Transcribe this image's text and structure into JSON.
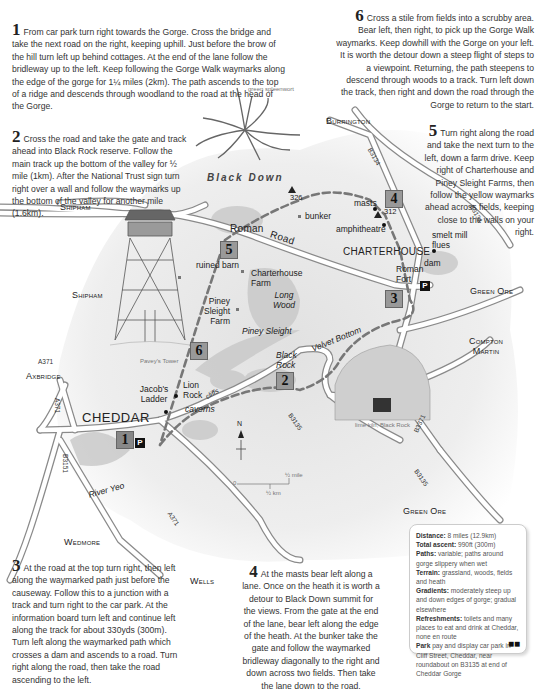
{
  "steps": [
    {
      "number": "1",
      "text": "From car park turn right towards the Gorge. Cross the bridge and take the next road on the right, keeping uphill. Just before the brow of the hill turn left up behind cottages. At the end of the lane follow the bridleway up to the left. Keep following the Gorge Walk waymarks along the edge of the gorge for 1¼ miles (2km). The path ascends to the top of a ridge and descends through woodland to the road at the head of the Gorge."
    },
    {
      "number": "2",
      "text": "Cross the road and take the gate and track ahead into Black Rock reserve. Follow the main track up the bottom of the valley for ½ mile (1km). After the National Trust sign turn right over a wall and follow the waymarks up the bottom of the valley for another mile (1.6km)."
    },
    {
      "number": "3",
      "text": "At the road at the top turn right, then left along the waymarked path just before the causeway. Follow this to a junction with a track and turn right to the car park. At the information board turn left and continue left along the track for about 330yds (300m). Turn left along the waymarked path which crosses a dam and ascends to a road. Turn right along the road, then take the road ascending to the left."
    },
    {
      "number": "4",
      "text": "At the masts bear left along a lane. Once on the heath it is worth a detour to Black Down summit for the views. From the gate at the end of the lane, bear left along the edge of the heath. At the bunker take the gate and follow the waymarked bridleway diagonally to the right and down across two fields. Then take the lane down to the road."
    },
    {
      "number": "5",
      "text": "Turn right along the road and take the next turn to the left, down a farm drive. Keep right of Charterhouse and Piney Sleight Farms, then follow the yellow waymarks ahead across fields, keeping close to the walls on your right."
    },
    {
      "number": "6",
      "text": "Cross a stile from fields into a scrubby area. Bear left, then right, to pick up the Gorge Walk waymarks. Keep dowhill with the Gorge on your left. It is worth the detour down a steep flight of steps to a viewpoint. Returning, the path steepens to descend through woods to a track. Turn left down the track, then right and down the road through the Gorge to return to the start."
    }
  ],
  "map": {
    "places": {
      "burrington": "Burrington",
      "shipham_top": "Shipham",
      "shipham_mid": "Shipham",
      "axbridge": "Axbridge",
      "wedmore": "Wedmore",
      "wells": "Wells",
      "green_ore_top": "Green Ore",
      "green_ore_bottom": "Green Ore",
      "compton_martin": "Compton Martin",
      "cheddar": "CHEDDAR",
      "charterhouse": "CHARTERHOUSE",
      "black_down": "Black Down",
      "roman_road": "Roman Road",
      "roman": "Roman",
      "road": "Road",
      "masts": "masts",
      "peak_312": "312",
      "peak_326": "326",
      "bunker": "bunker",
      "amphitheatre": "amphitheatre",
      "smelt_mill_flues": "smelt mill flues",
      "dam": "dam",
      "roman_fort": "Roman Fort",
      "ruined_barn": "ruined barn",
      "charterhouse_farm": "Charterhouse Farm",
      "piney_sleight_farm": "Piney Sleight Farm",
      "piney_sleight": "Piney Sleight",
      "long_wood": "Long Wood",
      "velvet_bottom": "Velvet Bottom",
      "black_rock": "Black Rock",
      "jacobs_ladder": "Jacob's Ladder",
      "lion_rock": "Lion Rock",
      "cliffs": "cliffs",
      "caverns": "caverns",
      "river_yeo": "River Yeo"
    },
    "roads": {
      "b3134_top": "B3134",
      "b3134_right": "B3134",
      "a371_left": "A371",
      "a371_vertical": "A371",
      "a371_bottom": "A371",
      "b3151": "B3151",
      "b3135_mid": "B3135",
      "b3135_right": "B3135",
      "b3371": "B3371"
    },
    "markers": [
      "1",
      "2",
      "3",
      "4",
      "5",
      "6"
    ],
    "parking_label": "P",
    "illustrations": {
      "fern": "green spleenwort",
      "tower": "Pavey's Tower",
      "limekiln": "lime kiln, Black Rock"
    },
    "compass": "N",
    "scale": {
      "zero": "0",
      "miles": "½ mile",
      "km": "½ km"
    }
  },
  "info": {
    "distance_label": "Distance:",
    "distance_value": "8 miles (12.9km)",
    "ascent_label": "Total ascent:",
    "ascent_value": "990ft (300m)",
    "paths_label": "Paths:",
    "paths_value": "variable; paths around gorge slippery when wet",
    "terrain_label": "Terrain:",
    "terrain_value": "grassland, woods, fields and heath",
    "gradients_label": "Gradients:",
    "gradients_value": "moderately steep up and down edges of gorge; gradual elsewhere",
    "refreshments_label": "Refreshments:",
    "refreshments_value": "toilets and many places to eat and drink at Cheddar, none en route",
    "park_label": "Park",
    "park_value": "pay and display car park in Cliff Street, Cheddar, near roundabout on B3135 at end of Cheddar Gorge"
  },
  "colors": {
    "road_fill": "#ffffff",
    "road_edge": "#8a8a8a",
    "route": "#777777",
    "marker_bg": "#9a9a9a",
    "wash": "#e6e6e6"
  }
}
